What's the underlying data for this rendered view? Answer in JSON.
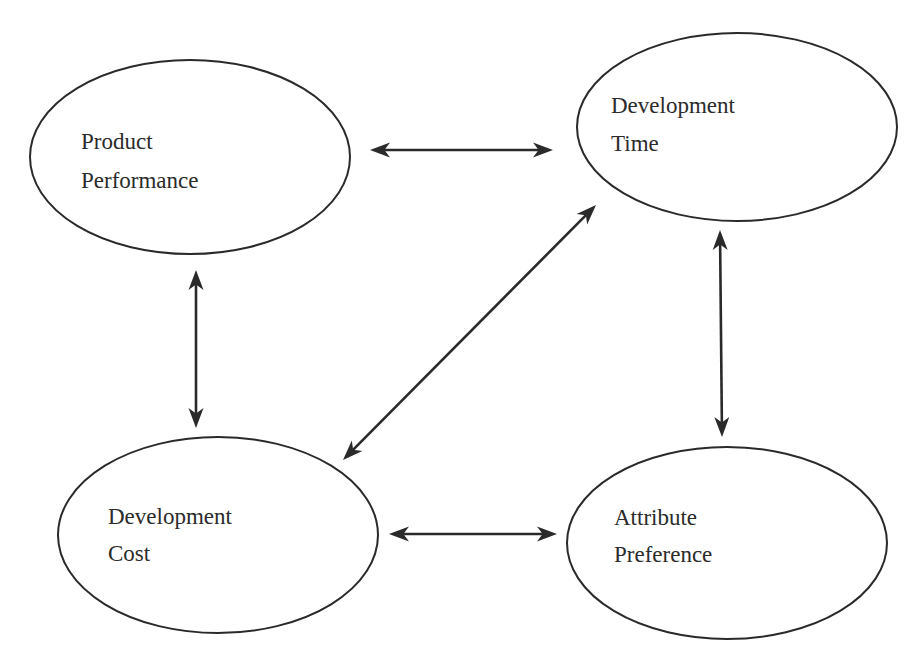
{
  "diagram": {
    "type": "relationship-diagram",
    "style": {
      "stroke_color": "#2a2a2a",
      "text_color": "#2b2b2b",
      "background": "#ffffff"
    },
    "nodes": [
      {
        "id": "product-performance",
        "line1": "Product",
        "line2": "Performance",
        "cx": 190,
        "cy": 157,
        "rx": 160,
        "ry": 97,
        "text_x": 81,
        "text_y1": 149,
        "text_y2": 188
      },
      {
        "id": "development-time",
        "line1": "Development",
        "line2": "Time",
        "cx": 737,
        "cy": 127,
        "rx": 160,
        "ry": 94,
        "text_x": 611,
        "text_y1": 113,
        "text_y2": 151
      },
      {
        "id": "development-cost",
        "line1": "Development",
        "line2": "Cost",
        "cx": 218,
        "cy": 535,
        "rx": 160,
        "ry": 98,
        "text_x": 108,
        "text_y1": 524,
        "text_y2": 561
      },
      {
        "id": "attribute-preference",
        "line1": "Attribute",
        "line2": "Preference",
        "cx": 727,
        "cy": 543,
        "rx": 160,
        "ry": 96,
        "text_x": 614,
        "text_y1": 525,
        "text_y2": 562
      }
    ],
    "edges": [
      {
        "id": "performance-time",
        "from": "product-performance",
        "to": "development-time",
        "bidirectional": true,
        "x1": 370,
        "y1": 150,
        "x2": 553,
        "y2": 150
      },
      {
        "id": "performance-cost",
        "from": "product-performance",
        "to": "development-cost",
        "bidirectional": true,
        "x1": 196,
        "y1": 270,
        "x2": 196,
        "y2": 428
      },
      {
        "id": "time-cost",
        "from": "development-time",
        "to": "development-cost",
        "bidirectional": true,
        "x1": 596,
        "y1": 205,
        "x2": 343,
        "y2": 460
      },
      {
        "id": "time-preference",
        "from": "development-time",
        "to": "attribute-preference",
        "bidirectional": true,
        "x1": 720,
        "y1": 230,
        "x2": 722,
        "y2": 437
      },
      {
        "id": "cost-preference",
        "from": "development-cost",
        "to": "attribute-preference",
        "bidirectional": true,
        "x1": 389,
        "y1": 534,
        "x2": 557,
        "y2": 534
      }
    ]
  }
}
